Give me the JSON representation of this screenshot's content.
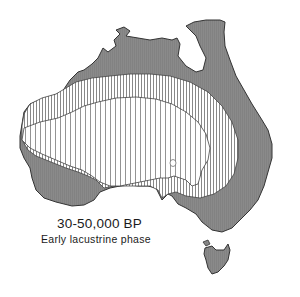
{
  "figure": {
    "title": "30-50,000 BP",
    "subtitle": "Early lacustrine phase"
  },
  "map": {
    "region": "Australia",
    "zones": [
      {
        "name": "outer-zone",
        "fill": "#8a8a8a",
        "pattern": "solid-grey"
      },
      {
        "name": "middle-zone",
        "fill": "#ffffff",
        "pattern": "dense-vertical-hatch"
      },
      {
        "name": "inner-zone",
        "fill": "#ffffff",
        "pattern": "sparse-vertical-hatch"
      }
    ],
    "colors": {
      "grey": "#8a8a8a",
      "line": "#333333",
      "background": "#ffffff"
    }
  }
}
